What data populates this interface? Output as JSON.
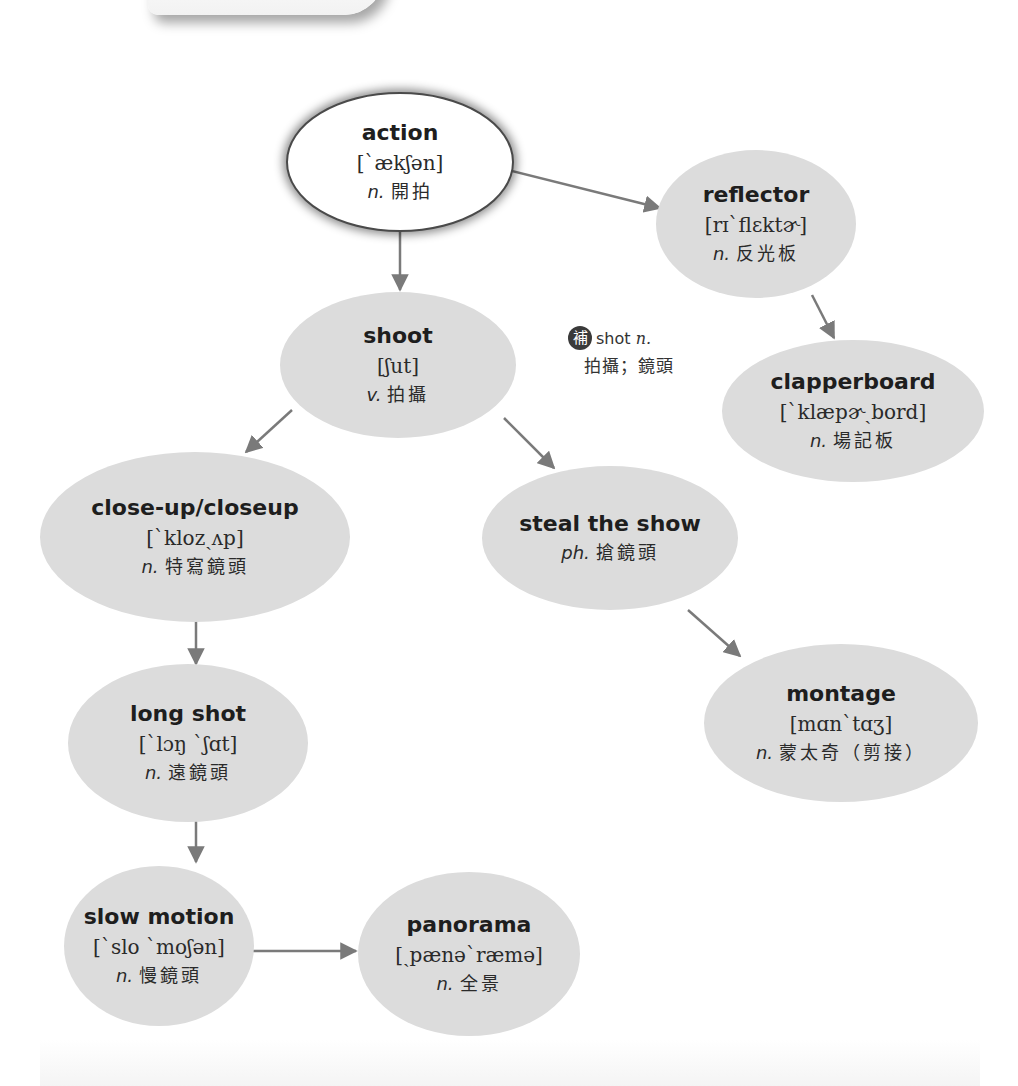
{
  "diagram": {
    "nodes": {
      "action": {
        "term": "action",
        "ipa": "[ˋækʃən]",
        "pos": "n.",
        "meaning": "開拍"
      },
      "reflector": {
        "term": "reflector",
        "ipa": "[rɪˋflɛktɚ]",
        "pos": "n.",
        "meaning": "反光板"
      },
      "shoot": {
        "term": "shoot",
        "ipa": "[ʃut]",
        "pos": "v.",
        "meaning": "拍攝"
      },
      "clapperboard": {
        "term": "clapperboard",
        "ipa": "[ˋklæpɚˏbord]",
        "pos": "n.",
        "meaning": "場記板"
      },
      "closeup": {
        "term": "close-up/closeup",
        "ipa": "[ˋklozˏʌp]",
        "pos": "n.",
        "meaning": "特寫鏡頭"
      },
      "steal_the_show": {
        "term": "steal the show",
        "pos": "ph.",
        "meaning": "搶鏡頭"
      },
      "montage": {
        "term": "montage",
        "ipa": "[mɑnˋtɑʒ]",
        "pos": "n.",
        "meaning": "蒙太奇（剪接）"
      },
      "long_shot": {
        "term": "long shot",
        "ipa": "[ˋlɔŋ ˋʃɑt]",
        "pos": "n.",
        "meaning": "遠鏡頭"
      },
      "slow_motion": {
        "term": "slow motion",
        "ipa": "[ˋslo ˋmoʃən]",
        "pos": "n.",
        "meaning": "慢鏡頭"
      },
      "panorama": {
        "term": "panorama",
        "ipa": "[ˏpænəˋræmə]",
        "pos": "n.",
        "meaning": "全景"
      }
    },
    "note": {
      "badge": "補",
      "word": "shot",
      "pos": "n.",
      "meaning": "拍攝；鏡頭"
    },
    "edges": [
      {
        "from": "action",
        "to": "reflector"
      },
      {
        "from": "action",
        "to": "shoot"
      },
      {
        "from": "reflector",
        "to": "clapperboard"
      },
      {
        "from": "shoot",
        "to": "close-up/closeup"
      },
      {
        "from": "shoot",
        "to": "steal the show"
      },
      {
        "from": "steal the show",
        "to": "montage"
      },
      {
        "from": "close-up/closeup",
        "to": "long shot"
      },
      {
        "from": "long shot",
        "to": "slow motion"
      },
      {
        "from": "slow motion",
        "to": "panorama"
      }
    ],
    "colors": {
      "node_fill": "#dcdcdc",
      "root_fill": "#ffffff",
      "arrow": "#7a7a7a",
      "text": "#1e1e1e"
    }
  }
}
